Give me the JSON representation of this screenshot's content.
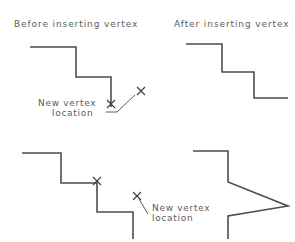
{
  "figure": {
    "background_color": "#ffffff",
    "line_color": "#4e4e4e",
    "text_color": "#5d5d5d",
    "width": 295,
    "height": 242
  },
  "panels": {
    "top_left": {
      "caption": "Before  inserting  vertex",
      "caption_pos": {
        "x": 14,
        "y": 27
      },
      "polyline": "M30,47 L76,47 L76,77 L111,77 L111,107",
      "vertex_mark": {
        "x": 111,
        "y": 104
      },
      "insert_mark": {
        "x": 141,
        "y": 91
      }
    },
    "top_right": {
      "caption": "After  inserting  vertex",
      "caption_pos": {
        "x": 174,
        "y": 27
      },
      "polyline": "M186,44 L222,44 L222,72 L254,72 L254,98 L288,98"
    },
    "bottom_left": {
      "polyline": "M22,153 L61,153 L61,183 L97,183 L97,212 L133,212 L133,239",
      "vertex_mark": {
        "x": 97,
        "y": 181
      }
    },
    "bottom_right": {
      "polyline": "M193,151 L228,151 L228,182 L288,206 L228,216 L228,239",
      "note_mark": {
        "x": 137,
        "y": 196
      }
    }
  },
  "annotations": {
    "top_note": {
      "line1": "New  vertex",
      "line2": "location",
      "line1_pos": {
        "x": 38,
        "y": 106
      },
      "line2_pos": {
        "x": 52,
        "y": 116
      },
      "leader": "M106,112 L117,112 L135,95"
    },
    "bottom_note": {
      "line1": "New  vertex",
      "line2": "location",
      "line1_pos": {
        "x": 152,
        "y": 211
      },
      "line2_pos": {
        "x": 152,
        "y": 221
      },
      "leader": "M139,199 L148,214"
    }
  }
}
